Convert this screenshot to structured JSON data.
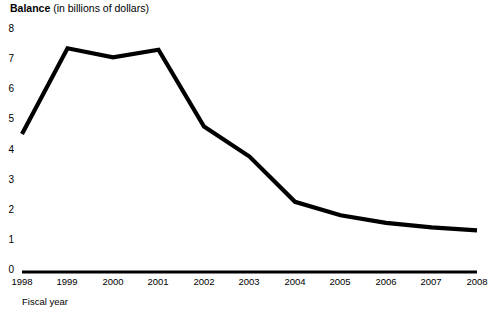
{
  "chart_data": {
    "type": "line",
    "title": "Balance (in billions of dollars)",
    "title_bold_part": "Balance",
    "title_rest_part": " (in billions of dollars)",
    "xlabel": "Fiscal year",
    "ylabel": "Balance (in billions of dollars)",
    "categories": [
      "1998",
      "1999",
      "2000",
      "2001",
      "2002",
      "2003",
      "2004",
      "2005",
      "2006",
      "2007",
      "2008"
    ],
    "x": [
      1998,
      1999,
      2000,
      2001,
      2002,
      2003,
      2004,
      2005,
      2006,
      2007,
      2008
    ],
    "values": [
      4.55,
      7.4,
      7.1,
      7.35,
      4.8,
      3.8,
      2.3,
      1.85,
      1.6,
      1.45,
      1.35
    ],
    "series": [
      {
        "name": "Balance",
        "values": [
          4.55,
          7.4,
          7.1,
          7.35,
          4.8,
          3.8,
          2.3,
          1.85,
          1.6,
          1.45,
          1.35
        ],
        "color": "#000000"
      }
    ],
    "ylim": [
      0,
      8
    ],
    "xlim": [
      1998,
      2008
    ],
    "y_ticks": [
      "0",
      "1",
      "2",
      "3",
      "4",
      "5",
      "6",
      "7",
      "8"
    ],
    "y_tick_values": [
      0,
      1,
      2,
      3,
      4,
      5,
      6,
      7,
      8
    ],
    "grid": false,
    "legend": false,
    "legend_position": "none",
    "line_color": "#000000",
    "axis_color": "#000000",
    "background_color": "#ffffff"
  }
}
